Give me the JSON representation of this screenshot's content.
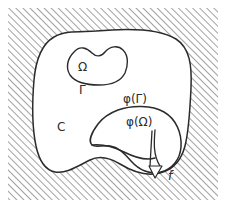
{
  "figure": {
    "kind": "mathematical-set-diagram",
    "caption": "",
    "background_color": "#ffffff",
    "ink_color": "#2b2b2b",
    "hatch_color": "#555555",
    "region_fill": "#ffffff",
    "hatch_angle_degrees": 45,
    "hatch_spacing_px": 5,
    "labels": {
      "omega": "Ω",
      "gamma": "Γ",
      "c": "C",
      "phi_gamma": "φ(Γ)",
      "phi_omega": "φ(Ω)",
      "f": "f"
    },
    "regions": [
      {
        "name": "outer-domain-C",
        "label": "C",
        "description": "large unshaded blob occupying most of the frame"
      },
      {
        "name": "inner-domain-omega",
        "label": "Ω",
        "description": "small kidney-shaped blob near the top, boundary labelled Γ"
      },
      {
        "name": "image-domain-phi-omega",
        "label": "φ(Ω)",
        "description": "lower-right blob, image of Ω under φ, boundary labelled φ(Γ)"
      },
      {
        "name": "hatched-exterior",
        "label": "",
        "description": "diagonally hatched complement outside C"
      }
    ],
    "annotations": [
      {
        "name": "flow-arrow-f",
        "label": "f",
        "direction": "down"
      }
    ]
  }
}
